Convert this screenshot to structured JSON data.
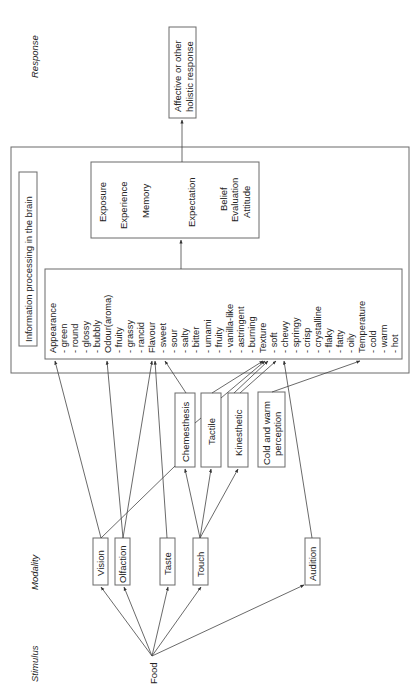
{
  "orientation": "rotated-90-ccw",
  "stage_labels": {
    "response": "Response",
    "modality": "Modality",
    "stimulus": "Stimulus"
  },
  "stimulus": {
    "label": "Food"
  },
  "modalities": [
    {
      "id": "vision",
      "label": "Vision"
    },
    {
      "id": "olfaction",
      "label": "Olfaction"
    },
    {
      "id": "taste",
      "label": "Taste"
    },
    {
      "id": "touch",
      "label": "Touch"
    },
    {
      "id": "audition",
      "label": "Audition"
    }
  ],
  "touch_submodalities": [
    {
      "id": "chemesthesis",
      "label": "Chemesthesis"
    },
    {
      "id": "tactile",
      "label": "Tactile"
    },
    {
      "id": "kinesthetic",
      "label": "Kinesthetic"
    },
    {
      "id": "cold-warm",
      "label_line1": "Cold and warm",
      "label_line2": "perception"
    }
  ],
  "brain": {
    "title": "Information processing in the brain",
    "attributes": [
      "Appearance",
      "- green",
      "- round",
      "- glossy",
      "- bubbly",
      "Odour(aroma)",
      "- fruity",
      "- grassy",
      "- rancid",
      "Flavour",
      "- sweet",
      "- sour",
      "- salty",
      "- bitter",
      "- umami",
      "- fruity",
      "- vanilla-like",
      "- astringent",
      "- burning",
      "Texture",
      "- soft",
      "- chewy",
      "- springy",
      "- crisp",
      "- crystalline",
      "- flaky",
      "- fatty",
      "- oily",
      "Temperature",
      "- cold",
      "- warm",
      "- hot"
    ],
    "cognition": {
      "exposure": "Exposure",
      "experience": "Experience",
      "memory": "Memory",
      "expectation": "Expectation",
      "belief": "Belief",
      "evaluation": "Evaluation",
      "attitude": "Attitude"
    }
  },
  "response": {
    "line1": "Affective or other",
    "line2": "holistic response"
  },
  "connections": [
    [
      "Food",
      "Vision"
    ],
    [
      "Food",
      "Olfaction"
    ],
    [
      "Food",
      "Taste"
    ],
    [
      "Food",
      "Touch"
    ],
    [
      "Food",
      "Audition"
    ],
    [
      "Vision",
      "Appearance"
    ],
    [
      "Vision",
      "Texture"
    ],
    [
      "Olfaction",
      "Odour(aroma)"
    ],
    [
      "Olfaction",
      "Flavour"
    ],
    [
      "Taste",
      "Flavour"
    ],
    [
      "Touch",
      "Chemesthesis"
    ],
    [
      "Touch",
      "Tactile"
    ],
    [
      "Touch",
      "Kinesthetic"
    ],
    [
      "Chemesthesis",
      "Flavour"
    ],
    [
      "Tactile",
      "Texture"
    ],
    [
      "Kinesthetic",
      "Texture"
    ],
    [
      "Cold and warm perception",
      "Temperature"
    ],
    [
      "Audition",
      "Texture"
    ],
    [
      "Attributes",
      "Memory/Expectation"
    ],
    [
      "Memory/Expectation",
      "Affective or other holistic response"
    ]
  ]
}
